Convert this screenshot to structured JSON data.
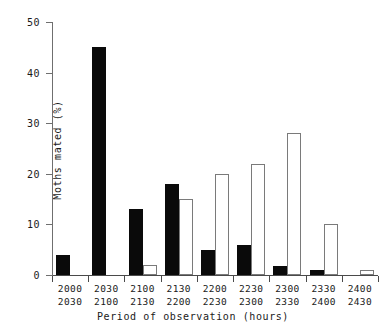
{
  "chart_data": {
    "type": "bar",
    "title": "",
    "xlabel": "Period of observation (hours)",
    "ylabel": "Moths mated (%)",
    "ylim": [
      0,
      50
    ],
    "yticks": [
      0,
      10,
      20,
      30,
      40,
      50
    ],
    "grid": false,
    "legend": null,
    "categories": [
      "2000\n2030",
      "2030\n2100",
      "2100\n2130",
      "2130\n2200",
      "2200\n2230",
      "2230\n2300",
      "2300\n2330",
      "2330\n2400",
      "2400\n2430"
    ],
    "category_lines": [
      [
        "2000",
        "2030"
      ],
      [
        "2030",
        "2100"
      ],
      [
        "2100",
        "2130"
      ],
      [
        "2130",
        "2200"
      ],
      [
        "2200",
        "2230"
      ],
      [
        "2230",
        "2300"
      ],
      [
        "2300",
        "2330"
      ],
      [
        "2330",
        "2400"
      ],
      [
        "2400",
        "2430"
      ]
    ],
    "series": [
      {
        "name": "filled",
        "style": "solid-black",
        "color": "#0a0a0a",
        "values": [
          4,
          45,
          13,
          18,
          5,
          6,
          1.8,
          1,
          0
        ]
      },
      {
        "name": "open",
        "style": "open-white",
        "color": "#ffffff",
        "values": [
          0,
          0,
          2,
          15,
          20,
          22,
          28,
          10,
          1
        ]
      }
    ]
  },
  "axes": {
    "y_tick_labels": [
      "0",
      "10",
      "20",
      "30",
      "40",
      "50"
    ],
    "y_axis_title": "Moths mated (%)",
    "x_axis_title": "Period of observation (hours)"
  }
}
